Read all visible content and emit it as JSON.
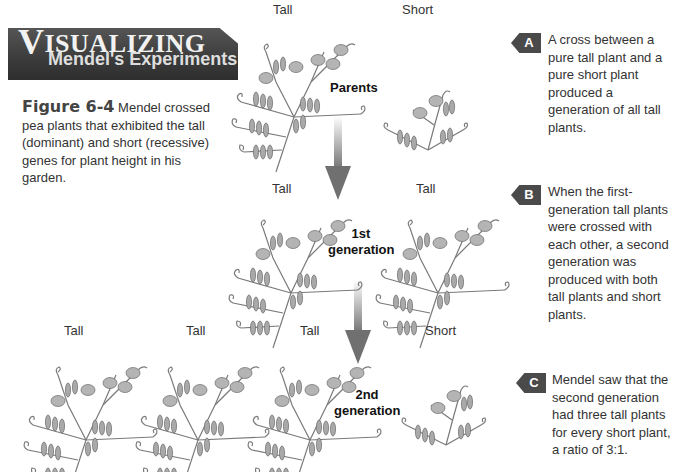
{
  "banner": {
    "title_initial": "V",
    "title_rest": "ISUALIZING",
    "subtitle": "Mendel's Experiments"
  },
  "caption": {
    "figure_label": "Figure 6-4",
    "text": " Mendel crossed pea plants that exhibited the tall (dominant) and short (recessive) genes for plant height in his garden."
  },
  "parents": {
    "generation_label": "Parents",
    "plants": [
      {
        "label": "Tall",
        "type": "tall"
      },
      {
        "label": "Short",
        "type": "short"
      }
    ]
  },
  "first_generation": {
    "generation_label_line1": "1st",
    "generation_label_line2": "generation",
    "plants": [
      {
        "label": "Tall",
        "type": "tall"
      },
      {
        "label": "Tall",
        "type": "tall"
      }
    ]
  },
  "second_generation": {
    "generation_label_line1": "2nd",
    "generation_label_line2": "generation",
    "plants": [
      {
        "label": "Tall",
        "type": "tall"
      },
      {
        "label": "Tall",
        "type": "tall"
      },
      {
        "label": "Tall",
        "type": "tall"
      },
      {
        "label": "Short",
        "type": "short"
      }
    ]
  },
  "notes": [
    {
      "tag": "A",
      "text": "A cross between a pure tall plant and a pure short plant produced a generation of all tall plants."
    },
    {
      "tag": "B",
      "text": "When the first-generation tall plants were crossed with each other, a second generation was produced with both tall plants and short plants."
    },
    {
      "tag": "C",
      "text": "Mendel saw that the second generation had three tall plants for every short plant, a ratio of 3:1."
    }
  ],
  "ratio": "3:1",
  "colors": {
    "banner": "#3b3b3b",
    "tag": "#4a4a4a",
    "arrow": "#707070",
    "plant_stroke": "#6a6a6a",
    "plant_fill": "#a8a8a8"
  }
}
